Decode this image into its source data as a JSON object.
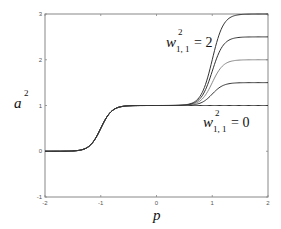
{
  "chart_data": {
    "type": "line",
    "title": "",
    "xlabel": "p",
    "ylabel": "a^2",
    "xlim": [
      -2,
      2
    ],
    "ylim": [
      -1,
      3
    ],
    "xticks": [
      -2,
      -1,
      0,
      1,
      2
    ],
    "yticks": [
      -1,
      0,
      1,
      2,
      3
    ],
    "grid": false,
    "legend": null,
    "annotations": [
      {
        "text": "w^2_{1,1} = 2",
        "base": "w",
        "sup": "2",
        "sub": "1, 1",
        "rest": "= 2",
        "near_p": 0.3,
        "near_a": 2.6
      },
      {
        "text": "w^2_{1,1} = 0",
        "base": "w",
        "sup": "2",
        "sub": "1, 1",
        "rest": "= 0",
        "near_p": 1.0,
        "near_a": 0.6
      }
    ],
    "parameter": "w^2_{1,1}",
    "x": [
      -2,
      -1.75,
      -1.5,
      -1.4,
      -1.3,
      -1.2,
      -1.1,
      -1.0,
      -0.9,
      -0.8,
      -0.7,
      -0.6,
      -0.5,
      -0.25,
      0,
      0.25,
      0.5,
      0.6,
      0.7,
      0.8,
      0.9,
      1.0,
      1.1,
      1.2,
      1.3,
      1.4,
      1.5,
      1.75,
      2
    ],
    "series": [
      {
        "name": "w = 0",
        "plateau": 1.0,
        "values": [
          0.0,
          0.0,
          0.01,
          0.02,
          0.05,
          0.12,
          0.27,
          0.5,
          0.73,
          0.88,
          0.95,
          0.98,
          0.99,
          1.0,
          1.0,
          1.0,
          1.0,
          1.0,
          1.0,
          1.0,
          1.0,
          1.0,
          1.0,
          1.0,
          1.0,
          1.0,
          1.0,
          1.0,
          1.0
        ]
      },
      {
        "name": "w = 0.5",
        "plateau": 1.5,
        "values": [
          0.0,
          0.0,
          0.01,
          0.02,
          0.05,
          0.12,
          0.27,
          0.5,
          0.73,
          0.88,
          0.95,
          0.98,
          1.0,
          1.0,
          1.0,
          1.0,
          1.0,
          1.01,
          1.02,
          1.06,
          1.13,
          1.25,
          1.37,
          1.44,
          1.48,
          1.49,
          1.5,
          1.5,
          1.5
        ]
      },
      {
        "name": "w = 1",
        "plateau": 2.0,
        "values": [
          0.0,
          0.0,
          0.01,
          0.02,
          0.05,
          0.12,
          0.27,
          0.5,
          0.73,
          0.88,
          0.95,
          0.98,
          1.0,
          1.0,
          1.0,
          1.0,
          1.01,
          1.02,
          1.05,
          1.12,
          1.27,
          1.5,
          1.73,
          1.88,
          1.95,
          1.98,
          1.99,
          2.0,
          2.0
        ]
      },
      {
        "name": "w = 1.5",
        "plateau": 2.5,
        "values": [
          0.0,
          0.0,
          0.01,
          0.02,
          0.05,
          0.12,
          0.27,
          0.5,
          0.73,
          0.88,
          0.95,
          0.98,
          1.0,
          1.0,
          1.0,
          1.0,
          1.01,
          1.03,
          1.07,
          1.18,
          1.4,
          1.75,
          2.1,
          2.32,
          2.43,
          2.47,
          2.49,
          2.5,
          2.5
        ]
      },
      {
        "name": "w = 2",
        "plateau": 3.0,
        "values": [
          0.0,
          0.0,
          0.01,
          0.02,
          0.05,
          0.12,
          0.27,
          0.5,
          0.73,
          0.88,
          0.95,
          0.98,
          1.0,
          1.0,
          1.0,
          1.0,
          1.01,
          1.04,
          1.1,
          1.24,
          1.54,
          2.0,
          2.46,
          2.76,
          2.9,
          2.96,
          2.99,
          3.0,
          3.0
        ]
      }
    ],
    "colors": [
      "#333333",
      "#333333",
      "#888888",
      "#333333",
      "#333333"
    ]
  }
}
